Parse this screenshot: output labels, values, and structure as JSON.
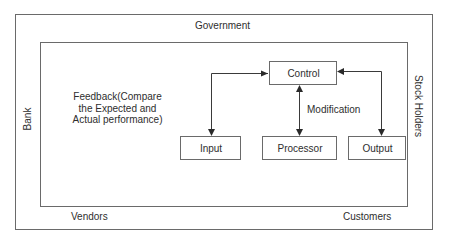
{
  "diagram": {
    "environment": {
      "top": "Government",
      "left": "Bank",
      "right": "Stock Holders",
      "bottom_left": "Vendors",
      "bottom_right": "Customers"
    },
    "feedback_note": "Feedback(Compare the Expected and Actual performance)",
    "nodes": {
      "control": "Control",
      "input": "Input",
      "processor": "Processor",
      "output": "Output"
    },
    "edges": [
      {
        "from": "input",
        "to": "control",
        "type": "bidirectional"
      },
      {
        "from": "processor",
        "to": "control",
        "type": "bidirectional",
        "label": "Modification"
      },
      {
        "from": "output",
        "to": "control",
        "type": "bidirectional"
      }
    ],
    "modification_label": "Modification",
    "colors": {
      "line": "#4a4a4a",
      "background": "#ffffff"
    }
  }
}
